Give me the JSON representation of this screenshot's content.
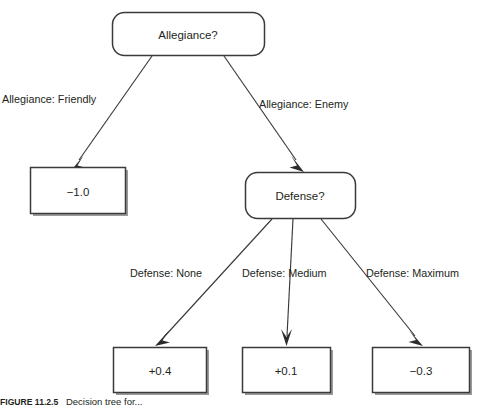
{
  "figure": {
    "background_color": "#ffffff",
    "stroke_color": "#3a3a3c",
    "text_color": "#231f20",
    "shadow_color": "#9a9a9c",
    "caption_label": "FIGURE 11.2.5",
    "caption_text": "Decision tree for...",
    "type": "decision-tree"
  },
  "nodes": {
    "root": {
      "label": "Allegiance?",
      "shape": "rounded-rect"
    },
    "defense": {
      "label": "Defense?",
      "shape": "rounded-rect"
    }
  },
  "leaves": {
    "friendly": {
      "label": "−1.0",
      "shape": "rect"
    },
    "defense_none": {
      "label": "+0.4",
      "shape": "rect"
    },
    "defense_medium": {
      "label": "+0.1",
      "shape": "rect"
    },
    "defense_maximum": {
      "label": "−0.3",
      "shape": "rect"
    }
  },
  "edges": {
    "allegiance_friendly": "Allegiance: Friendly",
    "allegiance_enemy": "Allegiance: Enemy",
    "defense_none": "Defense: None",
    "defense_medium": "Defense: Medium",
    "defense_maximum": "Defense: Maximum"
  }
}
